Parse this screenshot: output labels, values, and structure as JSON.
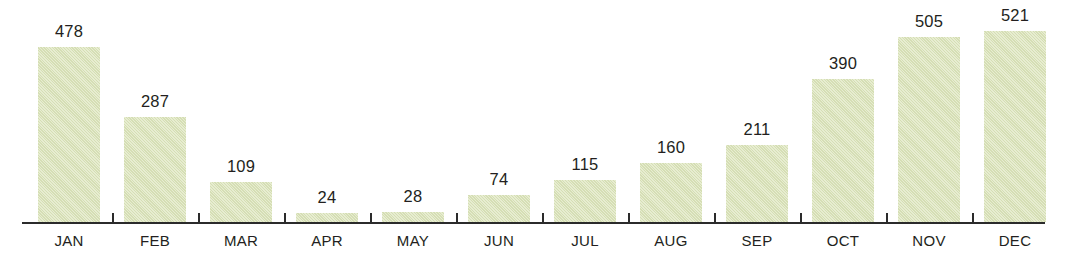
{
  "chart_data": {
    "type": "bar",
    "title": "",
    "subtitle": "",
    "xlabel": "",
    "ylabel": "",
    "categories": [
      "JAN",
      "FEB",
      "MAR",
      "APR",
      "MAY",
      "JUN",
      "JUL",
      "AUG",
      "SEP",
      "OCT",
      "NOV",
      "DEC"
    ],
    "values": [
      478,
      287,
      109,
      24,
      28,
      74,
      115,
      160,
      211,
      390,
      505,
      521
    ],
    "value_labels": [
      "478",
      "287",
      "109",
      "24",
      "28",
      "74",
      "115",
      "160",
      "211",
      "390",
      "505",
      "521"
    ],
    "ylim": [
      0,
      521
    ],
    "grid": false,
    "legend": null,
    "axis": {
      "x_axis_visible": true,
      "y_axis_visible": false,
      "tick_marks_between_categories": true
    },
    "style": {
      "bar_fill": "#dde5bd",
      "bar_border": "none",
      "axis_color": "#2b2b2b",
      "text_color": "#231f20",
      "background": "#ffffff",
      "texture": "diagonal-paper-hatch"
    }
  }
}
